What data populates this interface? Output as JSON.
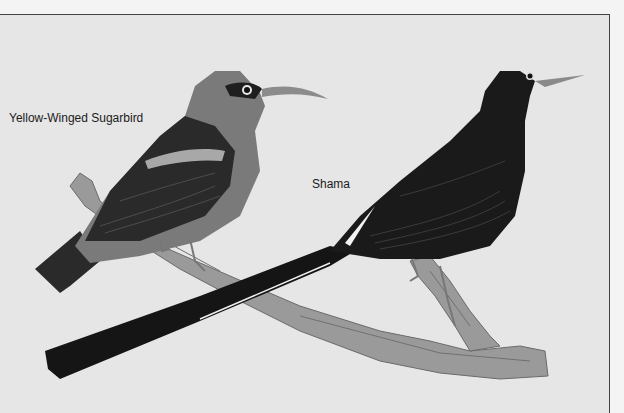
{
  "page": {
    "header_fragment": "",
    "illustration": {
      "style": "grayscale painted plate",
      "background_color": "#e6e6e6",
      "frame_color": "#444444"
    },
    "labels": {
      "sugarbird": "Yellow-Winged Sugarbird",
      "shama": "Shama"
    },
    "birds": [
      {
        "name": "sugarbird",
        "position": "left, perched on branch"
      },
      {
        "name": "shama",
        "position": "right, perched on branch with long tail"
      }
    ]
  }
}
